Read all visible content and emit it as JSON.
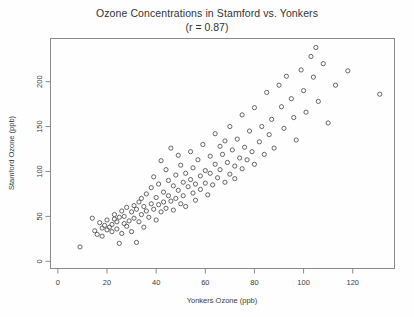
{
  "chart_data": {
    "type": "scatter",
    "title": "Ozone Concentrations in Stamford vs. Yonkers",
    "subtitle": "(r = 0.87)",
    "correlation": 0.87,
    "xlabel": "Yonkers Ozone (ppb)",
    "ylabel": "Stamford Ozone (ppb)",
    "xlim": [
      -3,
      137
    ],
    "ylim": [
      -8,
      248
    ],
    "xticks": [
      0,
      20,
      40,
      60,
      80,
      100,
      120
    ],
    "yticks": [
      0,
      50,
      100,
      150,
      200
    ],
    "grid": false,
    "legend": null,
    "marker": "open-circle",
    "marker_color": "#555555",
    "n_points": 136,
    "series": [
      {
        "name": "Daily ozone",
        "points": [
          [
            9,
            16
          ],
          [
            14,
            48
          ],
          [
            15,
            34
          ],
          [
            16,
            30
          ],
          [
            17,
            43
          ],
          [
            18,
            37
          ],
          [
            18,
            28
          ],
          [
            19,
            40
          ],
          [
            20,
            46
          ],
          [
            20,
            35
          ],
          [
            21,
            38
          ],
          [
            22,
            41
          ],
          [
            22,
            33
          ],
          [
            23,
            47
          ],
          [
            23,
            52
          ],
          [
            24,
            36
          ],
          [
            24,
            44
          ],
          [
            25,
            20
          ],
          [
            25,
            49
          ],
          [
            26,
            31
          ],
          [
            26,
            56
          ],
          [
            27,
            42
          ],
          [
            27,
            50
          ],
          [
            28,
            39
          ],
          [
            28,
            60
          ],
          [
            29,
            45
          ],
          [
            30,
            55
          ],
          [
            30,
            33
          ],
          [
            31,
            62
          ],
          [
            31,
            48
          ],
          [
            32,
            58
          ],
          [
            32,
            21
          ],
          [
            33,
            66
          ],
          [
            33,
            44
          ],
          [
            34,
            70
          ],
          [
            34,
            52
          ],
          [
            35,
            61
          ],
          [
            35,
            38
          ],
          [
            36,
            75
          ],
          [
            36,
            56
          ],
          [
            37,
            49
          ],
          [
            38,
            82
          ],
          [
            38,
            64
          ],
          [
            39,
            58
          ],
          [
            39,
            94
          ],
          [
            40,
            71
          ],
          [
            40,
            46
          ],
          [
            41,
            86
          ],
          [
            41,
            63
          ],
          [
            42,
            55
          ],
          [
            42,
            112
          ],
          [
            43,
            77
          ],
          [
            43,
            66
          ],
          [
            44,
            59
          ],
          [
            44,
            102
          ],
          [
            45,
            73
          ],
          [
            45,
            90
          ],
          [
            46,
            67
          ],
          [
            46,
            126
          ],
          [
            47,
            84
          ],
          [
            47,
            57
          ],
          [
            48,
            96
          ],
          [
            48,
            70
          ],
          [
            49,
            118
          ],
          [
            49,
            79
          ],
          [
            50,
            64
          ],
          [
            50,
            107
          ],
          [
            51,
            88
          ],
          [
            51,
            73
          ],
          [
            52,
            98
          ],
          [
            52,
            61
          ],
          [
            53,
            83
          ],
          [
            54,
            122
          ],
          [
            54,
            91
          ],
          [
            55,
            76
          ],
          [
            55,
            104
          ],
          [
            56,
            86
          ],
          [
            56,
            68
          ],
          [
            57,
            113
          ],
          [
            58,
            95
          ],
          [
            58,
            80
          ],
          [
            59,
            130
          ],
          [
            60,
            101
          ],
          [
            60,
            87
          ],
          [
            61,
            74
          ],
          [
            62,
            117
          ],
          [
            62,
            98
          ],
          [
            63,
            85
          ],
          [
            64,
            142
          ],
          [
            64,
            108
          ],
          [
            65,
            93
          ],
          [
            66,
            128
          ],
          [
            66,
            102
          ],
          [
            67,
            119
          ],
          [
            68,
            88
          ],
          [
            68,
            134
          ],
          [
            69,
            110
          ],
          [
            70,
            97
          ],
          [
            70,
            150
          ],
          [
            71,
            124
          ],
          [
            72,
            106
          ],
          [
            72,
            92
          ],
          [
            73,
            136
          ],
          [
            74,
            115
          ],
          [
            75,
            103
          ],
          [
            75,
            163
          ],
          [
            76,
            127
          ],
          [
            77,
            113
          ],
          [
            78,
            145
          ],
          [
            79,
            122
          ],
          [
            80,
            108
          ],
          [
            80,
            171
          ],
          [
            82,
            133
          ],
          [
            83,
            150
          ],
          [
            84,
            119
          ],
          [
            85,
            188
          ],
          [
            86,
            141
          ],
          [
            87,
            158
          ],
          [
            88,
            126
          ],
          [
            90,
            196
          ],
          [
            91,
            172
          ],
          [
            92,
            148
          ],
          [
            93,
            206
          ],
          [
            95,
            181
          ],
          [
            96,
            160
          ],
          [
            97,
            135
          ],
          [
            99,
            213
          ],
          [
            100,
            190
          ],
          [
            101,
            166
          ],
          [
            103,
            228
          ],
          [
            104,
            205
          ],
          [
            105,
            238
          ],
          [
            106,
            178
          ],
          [
            108,
            220
          ],
          [
            110,
            154
          ],
          [
            113,
            196
          ],
          [
            118,
            212
          ],
          [
            131,
            186
          ]
        ]
      }
    ]
  },
  "axes": {
    "x_axis_name": "x-axis",
    "y_axis_name": "y-axis"
  }
}
